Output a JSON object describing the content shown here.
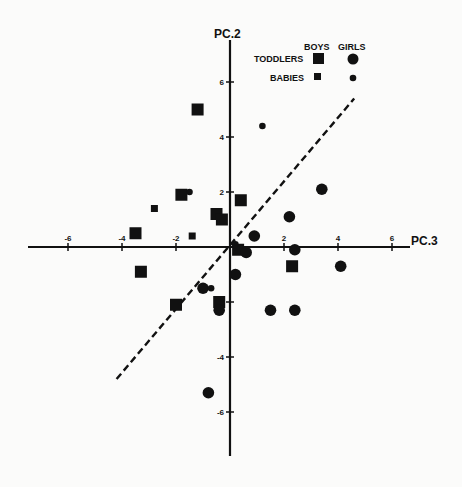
{
  "chart_data": {
    "type": "scatter",
    "title": "",
    "xlabel": "PC.3",
    "ylabel": "PC.2",
    "xlim": [
      -7.5,
      7
    ],
    "ylim": [
      -7.5,
      7.5
    ],
    "x_ticks": [
      "-6",
      "-4",
      "-2",
      "2",
      "4",
      "6"
    ],
    "x_tick_values": [
      -6,
      -4,
      -2,
      2,
      4,
      6
    ],
    "y_ticks": [
      "6",
      "4",
      "2",
      "-2",
      "-4",
      "-6"
    ],
    "y_tick_values": [
      6,
      4,
      2,
      -2,
      -4,
      -6
    ],
    "grid": false,
    "legend": {
      "position": "top-right",
      "columns": [
        "BOYS",
        "GIRLS"
      ],
      "rows": [
        "TODDLERS",
        "BABIES"
      ]
    },
    "series": [
      {
        "name": "Toddlers - Boys",
        "marker": "square-large",
        "points": [
          [
            -1.2,
            5.0
          ],
          [
            -1.8,
            1.9
          ],
          [
            -0.5,
            1.2
          ],
          [
            -0.3,
            1.0
          ],
          [
            0.4,
            1.7
          ],
          [
            -3.5,
            0.5
          ],
          [
            0.3,
            -0.1
          ],
          [
            2.3,
            -0.7
          ],
          [
            -3.3,
            -0.9
          ],
          [
            -2.0,
            -2.1
          ],
          [
            -0.4,
            -2.0
          ]
        ]
      },
      {
        "name": "Toddlers - Girls",
        "marker": "circle-large",
        "points": [
          [
            3.4,
            2.1
          ],
          [
            2.2,
            1.1
          ],
          [
            0.9,
            0.4
          ],
          [
            0.6,
            -0.2
          ],
          [
            2.4,
            -0.1
          ],
          [
            4.1,
            -0.7
          ],
          [
            0.2,
            -1.0
          ],
          [
            -1.0,
            -1.5
          ],
          [
            -0.4,
            -2.3
          ],
          [
            1.5,
            -2.3
          ],
          [
            2.4,
            -2.3
          ],
          [
            -0.8,
            -5.3
          ]
        ]
      },
      {
        "name": "Babies - Boys",
        "marker": "square-small",
        "points": [
          [
            -2.8,
            1.4
          ],
          [
            -1.4,
            0.4
          ]
        ]
      },
      {
        "name": "Babies - Girls",
        "marker": "circle-small",
        "points": [
          [
            1.2,
            4.4
          ],
          [
            -1.5,
            2.0
          ],
          [
            0.2,
            0.1
          ],
          [
            -0.7,
            -1.5
          ]
        ]
      }
    ],
    "annotations": [
      {
        "type": "dashed-line",
        "from": [
          -4.2,
          -4.8
        ],
        "to": [
          4.6,
          5.4
        ]
      }
    ]
  },
  "labels": {
    "x_axis": "PC.3",
    "y_axis": "PC.2",
    "legend_boys": "BOYS",
    "legend_girls": "GIRLS",
    "legend_toddlers": "TODDLERS",
    "legend_babies": "BABIES"
  },
  "colors": {
    "ink": "#111111",
    "background": "#fbfbfa"
  }
}
